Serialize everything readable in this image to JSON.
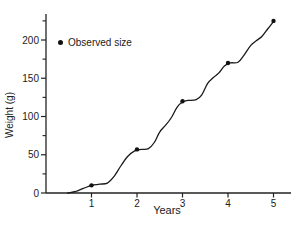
{
  "figure": {
    "background": "#ffffff",
    "axis_color": "#222222",
    "curve_color": "#1a1a1a",
    "marker_color": "#111111",
    "text_color": "#222222"
  },
  "chart_data": {
    "type": "line",
    "title": "",
    "xlabel": "Years",
    "ylabel": "Weight (g)",
    "xlim": [
      0,
      5.38
    ],
    "ylim": [
      0,
      234
    ],
    "xticks": [
      1,
      2,
      3,
      4,
      5
    ],
    "yticks_major": [
      0,
      50,
      100,
      150,
      200
    ],
    "yticks_minor": [
      25,
      75,
      125,
      175,
      225
    ],
    "grid": false,
    "legend": {
      "marker": "dot",
      "label": "Observed size",
      "position": "upper-left-inside"
    },
    "series": [
      {
        "name": "Growth curve",
        "kind": "line",
        "points": [
          [
            0.48,
            0
          ],
          [
            0.65,
            2
          ],
          [
            0.82,
            6
          ],
          [
            1.0,
            10
          ],
          [
            1.18,
            11.5
          ],
          [
            1.35,
            13
          ],
          [
            1.5,
            22
          ],
          [
            1.65,
            36
          ],
          [
            1.8,
            48
          ],
          [
            1.95,
            55
          ],
          [
            2.1,
            57
          ],
          [
            2.25,
            58
          ],
          [
            2.38,
            66
          ],
          [
            2.5,
            80
          ],
          [
            2.62,
            88
          ],
          [
            2.75,
            98
          ],
          [
            2.88,
            112
          ],
          [
            3.0,
            119
          ],
          [
            3.12,
            121
          ],
          [
            3.3,
            122
          ],
          [
            3.42,
            128
          ],
          [
            3.55,
            143
          ],
          [
            3.68,
            151
          ],
          [
            3.8,
            157
          ],
          [
            3.92,
            166
          ],
          [
            4.05,
            170
          ],
          [
            4.22,
            171
          ],
          [
            4.35,
            180
          ],
          [
            4.5,
            193
          ],
          [
            4.62,
            199
          ],
          [
            4.75,
            205
          ],
          [
            4.88,
            215
          ],
          [
            5.0,
            224
          ]
        ]
      },
      {
        "name": "Observed size",
        "kind": "scatter",
        "points": [
          [
            1,
            10
          ],
          [
            2,
            57
          ],
          [
            3,
            120
          ],
          [
            4,
            170
          ],
          [
            5,
            225
          ]
        ]
      }
    ]
  }
}
